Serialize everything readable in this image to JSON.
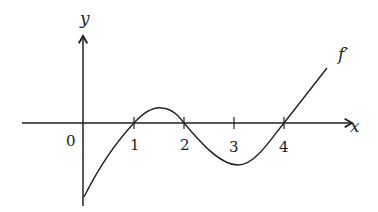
{
  "diagram": {
    "axes": {
      "x_label": "x",
      "y_label": "y",
      "origin_label": "0",
      "x_ticks": [
        "1",
        "2",
        "3",
        "4"
      ]
    },
    "curve_label": "f′",
    "colors": {
      "stroke": "#222222",
      "background": "#ffffff"
    }
  }
}
